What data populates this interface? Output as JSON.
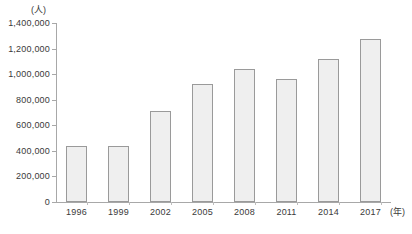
{
  "chart_data": {
    "type": "bar",
    "title": "",
    "subtitle": "",
    "xlabel": "(年)",
    "ylabel": "(人)",
    "categories": [
      "1996",
      "1999",
      "2002",
      "2005",
      "2008",
      "2011",
      "2014",
      "2017"
    ],
    "values": [
      435000,
      440000,
      715000,
      925000,
      1040000,
      965000,
      1120000,
      1275000
    ],
    "series": [
      {
        "name": "",
        "values": [
          435000,
          440000,
          715000,
          925000,
          1040000,
          965000,
          1120000,
          1275000
        ]
      }
    ],
    "ylim": [
      0,
      1400000
    ],
    "ytick_values": [
      0,
      200000,
      400000,
      600000,
      800000,
      1000000,
      1200000,
      1400000
    ],
    "ytick_labels": [
      "0",
      "200,000",
      "400,000",
      "600,000",
      "800,000",
      "1,000,000",
      "1,200,000",
      "1,400,000"
    ],
    "grid": false,
    "legend": null,
    "legend_position": "none",
    "annotations": [],
    "colors": {
      "bar_fill": "#efefef",
      "bar_border": "#9a9a9a",
      "axis": "#a8a8a8",
      "text": "#3a3a3a",
      "background": "#ffffff"
    }
  },
  "axis": {
    "y_unit_label": "(人)",
    "x_unit_label": "(年)"
  }
}
